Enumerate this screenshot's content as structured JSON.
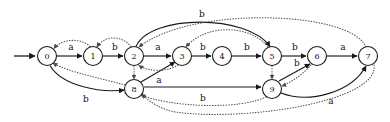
{
  "figure": {
    "background_color": "#ffffff",
    "solid_edge_color": "#1a1a1a",
    "dotted_edge_color": "#4a4a4a",
    "node_fill": "#ffffff",
    "node_stroke": "#1a1a1a"
  },
  "nodes": [
    {
      "id": "0",
      "label": "0",
      "cx": 47,
      "cy": 56,
      "r": 9.5
    },
    {
      "id": "1",
      "label": "1",
      "cx": 93,
      "cy": 56,
      "r": 9.5
    },
    {
      "id": "2",
      "label": "2",
      "cx": 134,
      "cy": 56,
      "r": 9.5
    },
    {
      "id": "3",
      "label": "3",
      "cx": 182,
      "cy": 56,
      "r": 9.5
    },
    {
      "id": "4",
      "label": "4",
      "cx": 222,
      "cy": 56,
      "r": 9.5
    },
    {
      "id": "5",
      "label": "5",
      "cx": 272,
      "cy": 56,
      "r": 9.5
    },
    {
      "id": "6",
      "label": "6",
      "cx": 317,
      "cy": 56,
      "r": 9.5
    },
    {
      "id": "7",
      "label": "7",
      "cx": 368,
      "cy": 56,
      "r": 9.5
    },
    {
      "id": "8",
      "label": "8",
      "cx": 134,
      "cy": 89,
      "r": 9.5
    },
    {
      "id": "9",
      "label": "9",
      "cx": 272,
      "cy": 89,
      "r": 9.5
    }
  ],
  "start": {
    "from": "0",
    "label": ""
  },
  "edges": [
    {
      "id": "e0-1",
      "from": "0",
      "to": "1",
      "label": "a",
      "style": "solid",
      "lx": 71,
      "ly": 47
    },
    {
      "id": "e1-2",
      "from": "1",
      "to": "2",
      "label": "b",
      "style": "solid",
      "lx": 115,
      "ly": 47
    },
    {
      "id": "e2-3",
      "from": "2",
      "to": "3",
      "label": "a",
      "style": "solid",
      "lx": 158,
      "ly": 47
    },
    {
      "id": "e3-4",
      "from": "3",
      "to": "4",
      "label": "b",
      "style": "solid",
      "lx": 203,
      "ly": 47
    },
    {
      "id": "e4-5",
      "from": "4",
      "to": "5",
      "label": "b",
      "style": "solid",
      "lx": 247,
      "ly": 47
    },
    {
      "id": "e5-6",
      "from": "5",
      "to": "6",
      "label": "b",
      "style": "solid",
      "lx": 295,
      "ly": 47
    },
    {
      "id": "e6-7",
      "from": "6",
      "to": "7",
      "label": "a",
      "style": "solid",
      "lx": 343,
      "ly": 47
    },
    {
      "id": "e2-5",
      "from": "2",
      "to": "5",
      "label": "b",
      "style": "solid",
      "lx": 202,
      "ly": 14
    },
    {
      "id": "e0-8",
      "from": "0",
      "to": "8",
      "label": "b",
      "style": "solid",
      "lx": 86,
      "ly": 99
    },
    {
      "id": "e8-3",
      "from": "8",
      "to": "3",
      "label": "a",
      "style": "solid",
      "lx": 158,
      "ly": 80
    },
    {
      "id": "e8-9",
      "from": "8",
      "to": "9",
      "label": "b",
      "style": "solid",
      "lx": 203,
      "ly": 97
    },
    {
      "id": "e9-6",
      "from": "9",
      "to": "6",
      "label": "b",
      "style": "solid",
      "lx": 297,
      "ly": 62
    },
    {
      "id": "e9-7",
      "from": "9",
      "to": "7",
      "label": "a",
      "style": "solid",
      "lx": 331,
      "ly": 101
    },
    {
      "id": "d1-0",
      "from": "1",
      "to": "0",
      "label": "",
      "style": "dotted",
      "lx": 0,
      "ly": 0
    },
    {
      "id": "d2-1",
      "from": "2",
      "to": "1",
      "label": "",
      "style": "dotted",
      "lx": 0,
      "ly": 0
    },
    {
      "id": "d3-2",
      "from": "3",
      "to": "2",
      "label": "",
      "style": "dotted",
      "lx": 0,
      "ly": 0
    },
    {
      "id": "d5-3",
      "from": "5",
      "to": "3",
      "label": "",
      "style": "dotted",
      "lx": 0,
      "ly": 0
    },
    {
      "id": "d7-2",
      "from": "7",
      "to": "2",
      "label": "",
      "style": "dotted",
      "lx": 0,
      "ly": 0
    },
    {
      "id": "d8-0",
      "from": "8",
      "to": "0",
      "label": "",
      "style": "dotted",
      "lx": 0,
      "ly": 0
    },
    {
      "id": "d2-8",
      "from": "2",
      "to": "8",
      "label": "",
      "style": "dotted",
      "lx": 0,
      "ly": 0
    },
    {
      "id": "d5-9",
      "from": "5",
      "to": "9",
      "label": "",
      "style": "dotted",
      "lx": 0,
      "ly": 0
    },
    {
      "id": "d6-9",
      "from": "6",
      "to": "9",
      "label": "",
      "style": "dotted",
      "lx": 0,
      "ly": 0
    },
    {
      "id": "d9-8",
      "from": "9",
      "to": "8",
      "label": "",
      "style": "dotted",
      "lx": 0,
      "ly": 0
    },
    {
      "id": "d7-8",
      "from": "7",
      "to": "8",
      "label": "",
      "style": "dotted",
      "lx": 0,
      "ly": 0
    }
  ],
  "edge_labels": {
    "top_arc_b": "b",
    "bottom_arc_b": "b",
    "lower_left_b": "b",
    "node9_to_7_a": "a"
  }
}
